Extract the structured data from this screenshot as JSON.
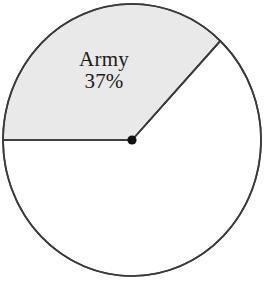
{
  "figure": {
    "width": 271,
    "height": 284,
    "background_color": "#ffffff"
  },
  "chart_data": {
    "type": "pie",
    "title": "",
    "subtitle": "",
    "xlabel": "",
    "ylabel": "",
    "legend": "none",
    "grid": false,
    "labels_position": "inside-slice",
    "start_angle_deg": 180,
    "direction": "counterclockwise-from-left",
    "categories": [
      "Army",
      "Other"
    ],
    "values": [
      37,
      63
    ],
    "value_unit": "%",
    "slices": [
      {
        "name": "Army",
        "label": "Army",
        "value": 37,
        "value_text": "37%",
        "share_fraction": 0.37,
        "sweep_deg": 133.2,
        "start_angle_deg": 180,
        "end_angle_deg": 46.8,
        "fill_color": "#e9e9e9",
        "stroke_color": "#3a3a3a",
        "labeled": true
      },
      {
        "name": "Other",
        "label": "",
        "value": 63,
        "value_text": "",
        "share_fraction": 0.63,
        "sweep_deg": 226.8,
        "start_angle_deg": 46.8,
        "end_angle_deg": 180,
        "fill_color": "#ffffff",
        "stroke_color": "#3a3a3a",
        "labeled": false
      }
    ]
  },
  "geometry": {
    "center_x": 132,
    "center_y": 140,
    "radius_x": 129,
    "radius_y": 136,
    "outline_stroke_width": 1.7,
    "radius_stroke_width": 1.7,
    "center_dot_radius": 4.6,
    "center_dot_color": "#111111",
    "outline_color": "#3a3a3a"
  },
  "colors": {
    "shaded_slice": "#e9e9e9",
    "unshaded_slice": "#ffffff",
    "stroke": "#3a3a3a",
    "text": "#1a1a1a",
    "background": "#ffffff"
  }
}
